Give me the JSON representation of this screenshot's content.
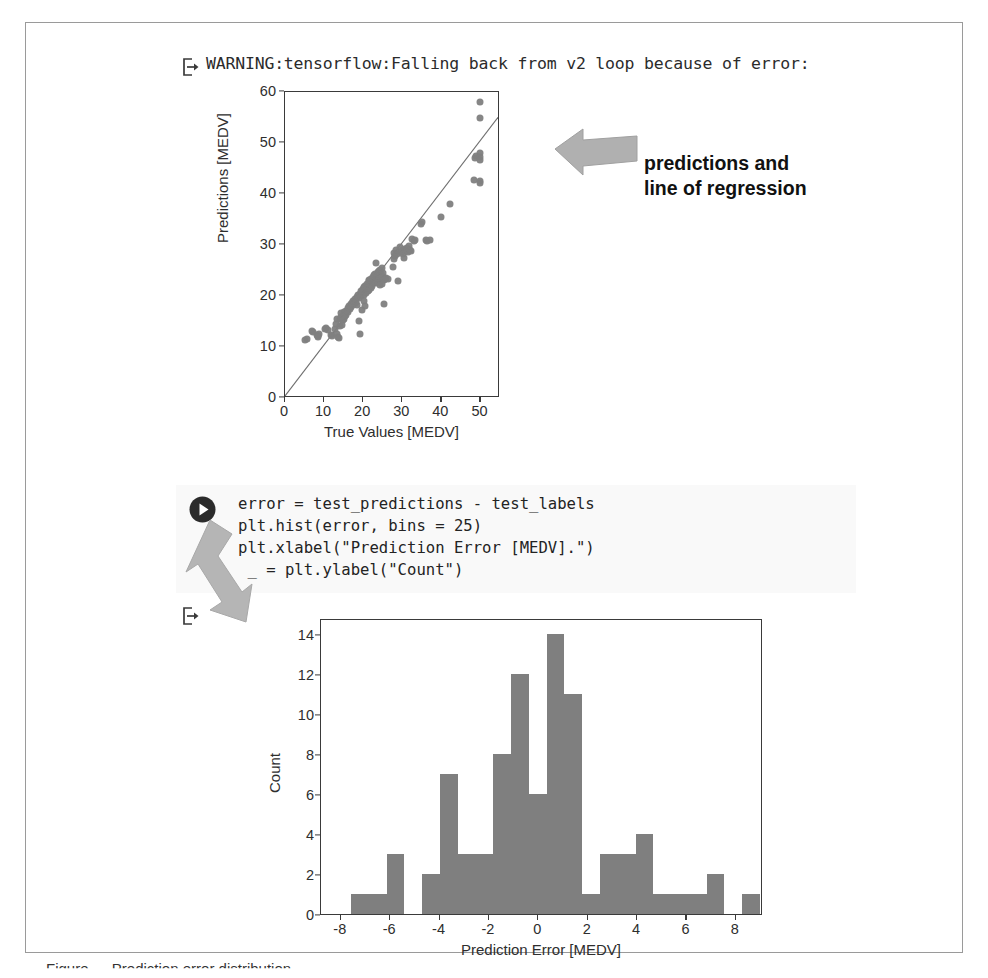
{
  "page": {
    "caption": "Figure — Prediction error distribution"
  },
  "warning_output": {
    "prompt_icon": "output-arrow-icon",
    "text": "WARNING:tensorflow:Falling back from v2 loop because of error:"
  },
  "scatter": {
    "xlabel": "True Values [MEDV]",
    "ylabel": "Predictions [MEDV]",
    "xticks": [
      "0",
      "10",
      "20",
      "30",
      "40",
      "50"
    ],
    "yticks": [
      "0",
      "10",
      "20",
      "30",
      "40",
      "50",
      "60"
    ]
  },
  "callout": {
    "arrow_icon": "left-arrow-annotation-icon",
    "text": "predictions and\nline of regression"
  },
  "code_cell": {
    "run_icon": "run-play-icon",
    "arrow_icon": "down-left-arrow-annotation-icon",
    "lines": [
      "error = test_predictions - test_labels",
      "plt.hist(error, bins = 25)",
      "plt.xlabel(\"Prediction Error [MEDV].\")",
      "_ = plt.ylabel(\"Count\")"
    ],
    "code_text": "error = test_predictions - test_labels\nplt.hist(error, bins = 25)\nplt.xlabel(\"Prediction Error [MEDV].\")\n _ = plt.ylabel(\"Count\")"
  },
  "hist_output": {
    "prompt_icon": "output-arrow-icon"
  },
  "histogram": {
    "xlabel": "Prediction Error [MEDV]",
    "ylabel": "Count",
    "xticks": [
      "-8",
      "-6",
      "-4",
      "-2",
      "0",
      "2",
      "4",
      "6",
      "8"
    ],
    "yticks": [
      "0",
      "2",
      "4",
      "6",
      "8",
      "10",
      "12",
      "14"
    ]
  },
  "colors": {
    "marker": "#7f7f7f",
    "bar": "#7f7f7f",
    "axis": "#3a3a3a",
    "annotation_arrow": "#a6a6a6",
    "frame": "#9a9a9a",
    "code_bg": "#f4f4f4"
  },
  "chart_data": [
    {
      "type": "scatter",
      "title": "",
      "xlabel": "True Values [MEDV]",
      "ylabel": "Predictions [MEDV]",
      "xlim": [
        0,
        55
      ],
      "ylim": [
        0,
        60
      ],
      "xticks": [
        0,
        10,
        20,
        30,
        40,
        50
      ],
      "yticks": [
        0,
        10,
        20,
        30,
        40,
        50,
        60
      ],
      "grid": false,
      "legend": null,
      "marker_color": "#7f7f7f",
      "reference_line": {
        "type": "identity",
        "from": [
          0,
          0
        ],
        "to": [
          55,
          55
        ]
      },
      "points": [
        [
          5.0,
          11.3
        ],
        [
          5.6,
          11.5
        ],
        [
          7.0,
          13.2
        ],
        [
          7.2,
          12.9
        ],
        [
          8.1,
          12.3
        ],
        [
          8.4,
          12.1
        ],
        [
          8.5,
          11.9
        ],
        [
          8.8,
          12.6
        ],
        [
          10.2,
          13.5
        ],
        [
          10.4,
          13.8
        ],
        [
          10.9,
          13.3
        ],
        [
          11.8,
          12.4
        ],
        [
          12.0,
          12.1
        ],
        [
          12.7,
          13.6
        ],
        [
          13.1,
          14.6
        ],
        [
          13.3,
          15.4
        ],
        [
          13.4,
          12.6
        ],
        [
          13.6,
          12.0
        ],
        [
          13.8,
          11.7
        ],
        [
          14.0,
          14.1
        ],
        [
          14.1,
          15.5
        ],
        [
          14.2,
          16.6
        ],
        [
          14.4,
          15.9
        ],
        [
          14.5,
          14.3
        ],
        [
          14.9,
          15.2
        ],
        [
          15.0,
          16.8
        ],
        [
          15.2,
          15.5
        ],
        [
          15.4,
          16.1
        ],
        [
          15.6,
          16.3
        ],
        [
          15.7,
          17.0
        ],
        [
          16.0,
          17.6
        ],
        [
          16.1,
          16.9
        ],
        [
          16.2,
          17.2
        ],
        [
          16.4,
          18.1
        ],
        [
          16.6,
          17.5
        ],
        [
          16.8,
          18.4
        ],
        [
          17.0,
          17.9
        ],
        [
          17.2,
          18.7
        ],
        [
          17.4,
          18.2
        ],
        [
          17.5,
          19.0
        ],
        [
          17.8,
          18.6
        ],
        [
          18.0,
          19.4
        ],
        [
          18.2,
          18.9
        ],
        [
          18.4,
          19.8
        ],
        [
          18.5,
          18.3
        ],
        [
          18.7,
          20.1
        ],
        [
          18.9,
          15.1
        ],
        [
          19.0,
          19.6
        ],
        [
          19.1,
          20.4
        ],
        [
          19.3,
          12.5
        ],
        [
          19.4,
          20.0
        ],
        [
          19.5,
          21.0
        ],
        [
          19.6,
          17.3
        ],
        [
          19.8,
          20.7
        ],
        [
          20.0,
          21.3
        ],
        [
          20.1,
          20.2
        ],
        [
          20.2,
          19.1
        ],
        [
          20.3,
          21.8
        ],
        [
          20.4,
          18.0
        ],
        [
          20.5,
          22.0
        ],
        [
          20.6,
          21.1
        ],
        [
          20.8,
          20.5
        ],
        [
          21.0,
          22.4
        ],
        [
          21.1,
          21.6
        ],
        [
          21.2,
          20.9
        ],
        [
          21.4,
          22.9
        ],
        [
          21.5,
          21.2
        ],
        [
          21.6,
          23.1
        ],
        [
          21.7,
          22.2
        ],
        [
          21.9,
          21.5
        ],
        [
          22.0,
          23.4
        ],
        [
          22.2,
          22.7
        ],
        [
          22.3,
          21.9
        ],
        [
          22.5,
          23.8
        ],
        [
          22.6,
          22.5
        ],
        [
          22.8,
          24.1
        ],
        [
          22.9,
          23.2
        ],
        [
          23.0,
          22.8
        ],
        [
          23.1,
          24.4
        ],
        [
          23.2,
          23.6
        ],
        [
          23.3,
          26.5
        ],
        [
          23.4,
          22.6
        ],
        [
          23.5,
          24.0
        ],
        [
          23.7,
          23.3
        ],
        [
          23.8,
          24.7
        ],
        [
          23.9,
          23.0
        ],
        [
          24.0,
          24.9
        ],
        [
          24.1,
          23.9
        ],
        [
          24.2,
          22.1
        ],
        [
          24.4,
          25.1
        ],
        [
          24.5,
          24.3
        ],
        [
          24.6,
          23.5
        ],
        [
          24.7,
          25.4
        ],
        [
          24.8,
          22.3
        ],
        [
          25.0,
          23.7
        ],
        [
          25.1,
          24.6
        ],
        [
          25.2,
          18.4
        ],
        [
          25.3,
          23.1
        ],
        [
          25.5,
          23.4
        ],
        [
          25.9,
          23.6
        ],
        [
          26.4,
          23.3
        ],
        [
          27.5,
          25.6
        ],
        [
          27.9,
          27.3
        ],
        [
          28.0,
          28.4
        ],
        [
          28.2,
          27.9
        ],
        [
          28.5,
          29.1
        ],
        [
          28.7,
          28.2
        ],
        [
          29.0,
          23.0
        ],
        [
          29.4,
          29.6
        ],
        [
          29.6,
          28.7
        ],
        [
          30.1,
          29.0
        ],
        [
          30.3,
          28.3
        ],
        [
          30.5,
          27.4
        ],
        [
          30.8,
          29.2
        ],
        [
          31.0,
          28.8
        ],
        [
          31.2,
          29.4
        ],
        [
          31.5,
          28.6
        ],
        [
          31.6,
          29.9
        ],
        [
          32.0,
          29.1
        ],
        [
          32.2,
          28.9
        ],
        [
          32.5,
          31.1
        ],
        [
          33.0,
          30.8
        ],
        [
          33.2,
          31.0
        ],
        [
          34.9,
          34.2
        ],
        [
          35.1,
          34.5
        ],
        [
          36.0,
          31.0
        ],
        [
          36.2,
          30.8
        ],
        [
          37.0,
          31.0
        ],
        [
          39.8,
          35.5
        ],
        [
          42.3,
          38.0
        ],
        [
          48.3,
          42.8
        ],
        [
          48.5,
          47.0
        ],
        [
          48.8,
          47.4
        ],
        [
          50.0,
          58.0
        ],
        [
          50.0,
          55.0
        ],
        [
          50.0,
          48.0
        ],
        [
          50.0,
          47.2
        ],
        [
          50.0,
          46.6
        ],
        [
          50.0,
          42.5
        ],
        [
          50.0,
          42.2
        ]
      ]
    },
    {
      "type": "bar",
      "subtype": "histogram",
      "title": "",
      "xlabel": "Prediction Error [MEDV]",
      "ylabel": "Count",
      "bins": 25,
      "xlim": [
        -8.8,
        9.1
      ],
      "ylim": [
        0,
        14.8
      ],
      "xticks": [
        -8,
        -6,
        -4,
        -2,
        0,
        2,
        4,
        6,
        8
      ],
      "yticks": [
        0,
        2,
        4,
        6,
        8,
        10,
        12,
        14
      ],
      "grid": false,
      "bar_color": "#7f7f7f",
      "bin_edges": [
        -8.3,
        -7.58,
        -6.86,
        -6.14,
        -5.42,
        -4.7,
        -3.98,
        -3.26,
        -2.54,
        -1.82,
        -1.1,
        -0.38,
        0.34,
        1.06,
        1.78,
        2.5,
        3.22,
        3.94,
        4.66,
        5.38,
        6.1,
        6.82,
        7.54,
        8.26
      ],
      "bin_centers": [
        -7.9,
        -7.2,
        -6.5,
        -5.8,
        -5.1,
        -4.3,
        -3.6,
        -2.9,
        -2.2,
        -1.5,
        -0.7,
        0.0,
        0.7,
        1.4,
        2.1,
        2.9,
        3.6,
        4.3,
        5.0,
        5.7,
        6.4,
        7.2,
        7.9
      ],
      "values": [
        0,
        1,
        1,
        3,
        0,
        2,
        7,
        3,
        3,
        8,
        12,
        6,
        14,
        11,
        1,
        3,
        3,
        4,
        1,
        1,
        1,
        2,
        0,
        1
      ]
    }
  ]
}
